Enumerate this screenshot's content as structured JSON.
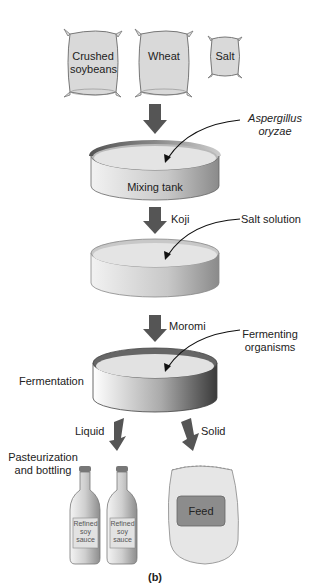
{
  "diagram": {
    "caption": "(b)",
    "ingredients": [
      {
        "label_line1": "Crushed",
        "label_line2": "soybeans"
      },
      {
        "label_line1": "Wheat"
      },
      {
        "label_line1": "Salt"
      }
    ],
    "tanks": [
      {
        "name": "Mixing tank",
        "annotation_line1": "Aspergillus",
        "annotation_line2": "oryzae"
      },
      {
        "flow_label": "Koji",
        "annotation": "Salt solution"
      },
      {
        "flow_label": "Moromi",
        "annotation_line1": "Fermenting",
        "annotation_line2": "organisms",
        "side_label": "Fermentation"
      }
    ],
    "outputs": {
      "liquid_label": "Liquid",
      "solid_label": "Solid",
      "liquid_step_line1": "Pasteurization",
      "liquid_step_line2": "and bottling",
      "bottle_label_line1": "Refined",
      "bottle_label_line2": "soy",
      "bottle_label_line3": "sauce",
      "solid_product": "Feed"
    },
    "colors": {
      "bag_fill": "#d9d9d9",
      "tank_fill": "#e4e4e4",
      "arrow": "#555555",
      "feed_label": "#8c8c8c"
    }
  }
}
